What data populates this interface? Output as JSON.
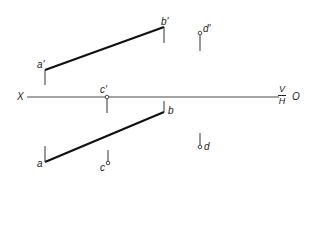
{
  "diagram": {
    "type": "orthographic-projection",
    "axis": {
      "left_label": "X",
      "right_label": "O",
      "upper_plane": "V",
      "lower_plane": "H"
    },
    "labels": {
      "a_prime": "a'",
      "b_prime": "b'",
      "c_prime": "c'",
      "d_prime": "d'",
      "a": "a",
      "b": "b",
      "c": "c",
      "d": "d"
    },
    "line_color": "#222222",
    "background": "#ffffff"
  }
}
